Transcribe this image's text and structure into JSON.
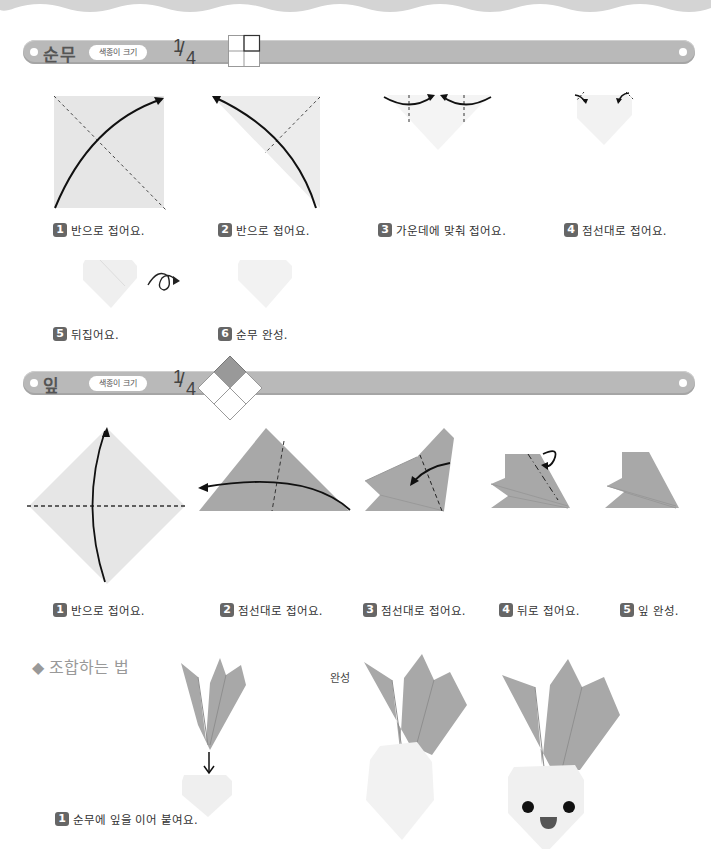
{
  "colors": {
    "banner": "#b9b9b9",
    "paper_light": "#e8e8e8",
    "leaf": "#a8a8a8",
    "badge": "#666666",
    "heading": "#999999"
  },
  "sections": [
    {
      "title": "순무",
      "paper_size_label": "색종이 크기",
      "fraction": {
        "numerator": "1",
        "denominator": "4"
      },
      "steps": [
        {
          "number": "1",
          "text": "반으로 접어요."
        },
        {
          "number": "2",
          "text": "반으로 접어요."
        },
        {
          "number": "3",
          "text": "가운데에 맞춰 접어요."
        },
        {
          "number": "4",
          "text": "점선대로 접어요."
        },
        {
          "number": "5",
          "text": "뒤집어요."
        },
        {
          "number": "6",
          "text": "순무 완성."
        }
      ]
    },
    {
      "title": "잎",
      "paper_size_label": "색종이 크기",
      "fraction": {
        "numerator": "1",
        "denominator": "4"
      },
      "steps": [
        {
          "number": "1",
          "text": "반으로 접어요."
        },
        {
          "number": "2",
          "text": "점선대로 접어요."
        },
        {
          "number": "3",
          "text": "점선대로 접어요."
        },
        {
          "number": "4",
          "text": "뒤로 접어요."
        },
        {
          "number": "5",
          "text": "잎 완성."
        }
      ]
    }
  ],
  "assembly": {
    "heading": "◆ 조합하는 법",
    "completed_label": "완성",
    "steps": [
      {
        "number": "1",
        "text": "순무에 잎을 이어 붙여요."
      }
    ]
  }
}
